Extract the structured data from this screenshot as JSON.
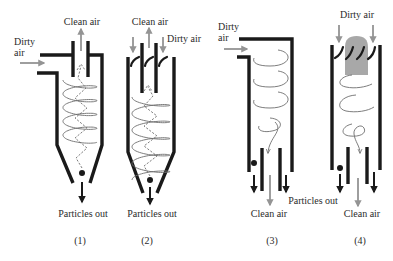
{
  "figure": {
    "cyclones": [
      {
        "caption": "(1)",
        "inlet_label_lines": [
          "Dirty",
          "air"
        ],
        "outlet_label": "Clean air",
        "particles_label": "Particles out"
      },
      {
        "caption": "(2)",
        "inlet_label": "Dirty air",
        "outlet_label": "Clean air",
        "particles_label": "Particles out"
      },
      {
        "caption": "(3)",
        "inlet_label_lines": [
          "Dirty",
          "air"
        ],
        "outlet_label": "Clean air",
        "particles_label": "Particles out"
      },
      {
        "caption": "(4)",
        "inlet_label": "Dirty air",
        "outlet_label": "Clean air"
      }
    ]
  },
  "colors": {
    "wall": "#1a1a1a",
    "flow_arrow": "#949494",
    "vortex_line": "#6e6e6e",
    "core_shading": "#a8a8a8",
    "text": "#2b2b2b"
  }
}
